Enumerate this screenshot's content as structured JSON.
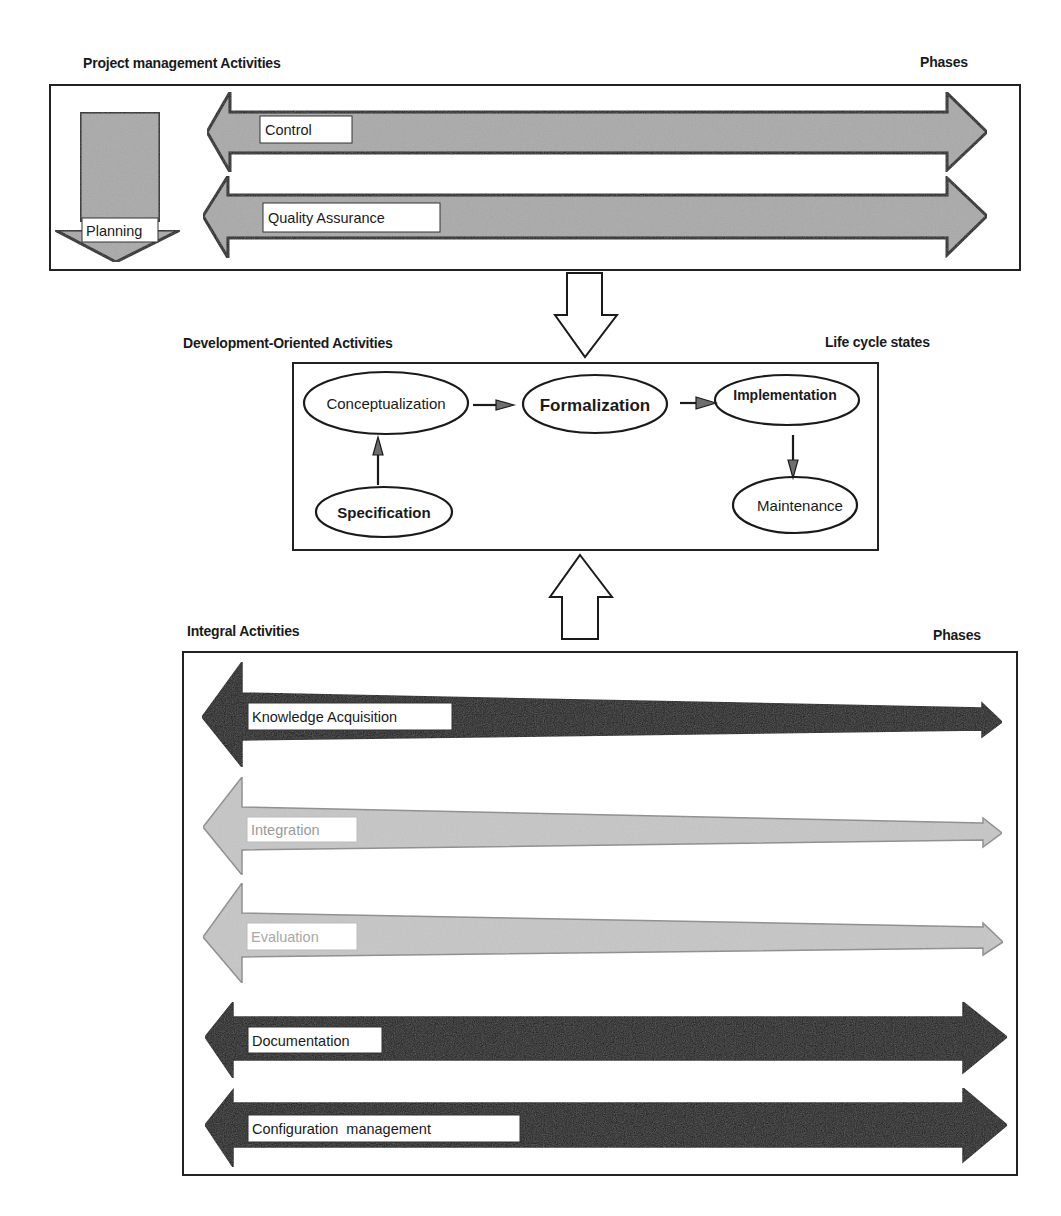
{
  "project_management": {
    "title": "Project management Activities",
    "phases_label": "Phases",
    "planning_label": "Planning",
    "arrows": [
      {
        "label": "Control"
      },
      {
        "label": "Quality Assurance"
      }
    ]
  },
  "development": {
    "title": "Development-Oriented Activities",
    "states_label": "Life cycle states",
    "nodes": {
      "conceptualization": "Conceptualization",
      "formalization": "Formalization",
      "implementation": "Implementation",
      "specification": "Specification",
      "maintenance": "Maintenance"
    },
    "flows": [
      {
        "from": "Specification",
        "to": "Conceptualization"
      },
      {
        "from": "Conceptualization",
        "to": "Formalization"
      },
      {
        "from": "Formalization",
        "to": "Implementation"
      },
      {
        "from": "Implementation",
        "to": "Maintenance"
      }
    ]
  },
  "integral": {
    "title": "Integral Activities",
    "phases_label": "Phases",
    "arrows": [
      {
        "label": "Knowledge Acquisition",
        "shade": "dark-tapered"
      },
      {
        "label": "Integration",
        "shade": "light-tapered"
      },
      {
        "label": "Evaluation",
        "shade": "light-tapered"
      },
      {
        "label": "Documentation",
        "shade": "black"
      },
      {
        "label": "Configuration  management",
        "shade": "black"
      }
    ]
  },
  "colors": {
    "management_arrow": "#a9a9a9",
    "light_arrow": "#c6c6c6",
    "dark_arrow": "#161616",
    "outline": "#1a1a1a",
    "background": "#ffffff"
  }
}
